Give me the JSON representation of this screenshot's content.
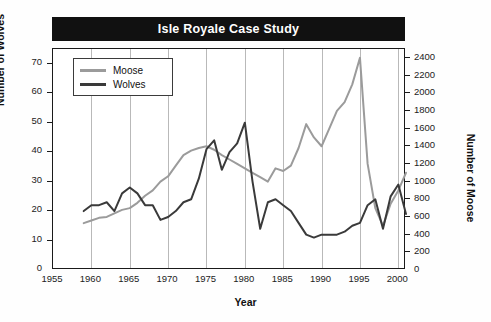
{
  "chart_data": {
    "type": "line",
    "title": "Isle Royale Case Study",
    "xlabel": "Year",
    "ylabel": "Number of Wolves",
    "ylabel_right": "Number of Moose",
    "xlim": [
      1955,
      2001
    ],
    "ylim": [
      0,
      75
    ],
    "ylim_right": [
      0,
      2500
    ],
    "xticks": [
      1955,
      1960,
      1965,
      1970,
      1975,
      1980,
      1985,
      1990,
      1995,
      2000
    ],
    "yticks": [
      0,
      10,
      20,
      30,
      40,
      50,
      60,
      70
    ],
    "yticks_right": [
      0,
      200,
      400,
      600,
      800,
      1000,
      1200,
      1400,
      1600,
      1800,
      2000,
      2200,
      2400
    ],
    "grid": "vertical",
    "legend_position": "top-left",
    "colors": {
      "moose": "#9b9b9b",
      "wolves": "#3a3a3a",
      "title_banner": "#111111",
      "title_text": "#ffffff",
      "axis": "#1a1a1a",
      "gridline": "#b9b9b9"
    },
    "series": [
      {
        "name": "Moose",
        "axis": "right",
        "color": "#9b9b9b",
        "x": [
          1959,
          1960,
          1961,
          1962,
          1963,
          1964,
          1965,
          1966,
          1967,
          1968,
          1969,
          1970,
          1971,
          1972,
          1973,
          1974,
          1975,
          1976,
          1977,
          1978,
          1979,
          1980,
          1981,
          1982,
          1983,
          1984,
          1985,
          1986,
          1987,
          1988,
          1989,
          1990,
          1991,
          1992,
          1993,
          1994,
          1995,
          1996,
          1997,
          1998,
          1999,
          2000,
          2001
        ],
        "values": [
          530,
          560,
          590,
          600,
          640,
          680,
          700,
          760,
          840,
          900,
          1000,
          1060,
          1180,
          1300,
          1350,
          1380,
          1400,
          1360,
          1300,
          1250,
          1200,
          1150,
          1100,
          1050,
          1000,
          1150,
          1120,
          1180,
          1380,
          1650,
          1500,
          1400,
          1600,
          1800,
          1900,
          2100,
          2400,
          1200,
          700,
          500,
          750,
          900,
          1100
        ]
      },
      {
        "name": "Wolves",
        "axis": "left",
        "color": "#3a3a3a",
        "x": [
          1959,
          1960,
          1961,
          1962,
          1963,
          1964,
          1965,
          1966,
          1967,
          1968,
          1969,
          1970,
          1971,
          1972,
          1973,
          1974,
          1975,
          1976,
          1977,
          1978,
          1979,
          1980,
          1981,
          1982,
          1983,
          1984,
          1985,
          1986,
          1987,
          1988,
          1989,
          1990,
          1991,
          1992,
          1993,
          1994,
          1995,
          1996,
          1997,
          1998,
          1999,
          2000,
          2001
        ],
        "values": [
          20,
          22,
          22,
          23,
          20,
          26,
          28,
          26,
          22,
          22,
          17,
          18,
          20,
          23,
          24,
          31,
          41,
          44,
          34,
          40,
          43,
          50,
          30,
          14,
          23,
          24,
          22,
          20,
          16,
          12,
          11,
          12,
          12,
          12,
          13,
          15,
          16,
          22,
          24,
          14,
          25,
          29,
          19
        ]
      }
    ]
  },
  "legend": {
    "items": [
      {
        "label": "Moose",
        "color": "#9b9b9b"
      },
      {
        "label": "Wolves",
        "color": "#3a3a3a"
      }
    ]
  }
}
